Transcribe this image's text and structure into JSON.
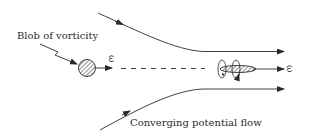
{
  "diagram": {
    "labels": {
      "blob": "Blob of vorticity",
      "flow": "Converging potential flow",
      "omega_left": "ω",
      "omega_right": "ω"
    },
    "colors": {
      "stroke": "#2a2a2a",
      "background": "#ffffff"
    },
    "elements": [
      "blob-of-vorticity (hatched circle)",
      "vorticity vector arrow (left)",
      "dashed axis line",
      "upper converging streamline",
      "lower converging streamline",
      "stretched vortex tube (hatched ellipse with swirl rings)",
      "vorticity vector arrow (right)"
    ]
  }
}
